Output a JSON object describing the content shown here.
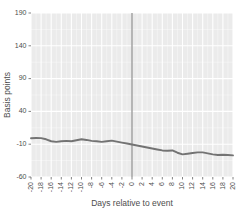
{
  "chart_data": {
    "type": "line",
    "title": "",
    "subtitle": "",
    "xlabel": "Days relative to event",
    "ylabel": "Basis points",
    "xlim": [
      -20,
      20
    ],
    "ylim": [
      -60,
      190
    ],
    "grid": true,
    "legend": null,
    "legend_position": "none",
    "x_ticks": [
      -20,
      -18,
      -16,
      -14,
      -12,
      -10,
      -8,
      -6,
      -4,
      -2,
      0,
      2,
      4,
      6,
      8,
      10,
      12,
      14,
      16,
      18,
      20
    ],
    "x_tick_labels": [
      "-20",
      "-18",
      "-16",
      "-14",
      "-12",
      "-10",
      "-8",
      "-6",
      "-4",
      "-2",
      "0",
      "2",
      "4",
      "6",
      "8",
      "10",
      "12",
      "14",
      "16",
      "18",
      "20"
    ],
    "y_ticks": [
      -60,
      -10,
      40,
      90,
      140,
      190
    ],
    "y_tick_labels": [
      "-60",
      "-10",
      "40",
      "90",
      "140",
      "190"
    ],
    "annotations": [
      {
        "name": "event-vertical-line",
        "type": "vline",
        "x": 0
      }
    ],
    "series": [
      {
        "name": "cumulative-abnormal-return",
        "color": "#737373",
        "x": [
          -20,
          -19,
          -18,
          -17,
          -16,
          -15,
          -14,
          -13,
          -12,
          -11,
          -10,
          -9,
          -8,
          -7,
          -6,
          -5,
          -4,
          -3,
          -2,
          -1,
          0,
          1,
          2,
          3,
          4,
          5,
          6,
          7,
          8,
          9,
          10,
          11,
          12,
          13,
          14,
          15,
          16,
          17,
          18,
          19,
          20
        ],
        "values": [
          -1.0,
          -0.5,
          -0.8,
          -2.5,
          -5.5,
          -6.5,
          -5.5,
          -5.0,
          -5.5,
          -4.0,
          -2.5,
          -3.5,
          -5.0,
          -5.5,
          -6.5,
          -5.5,
          -4.5,
          -6.0,
          -7.5,
          -9.0,
          -10.5,
          -12.0,
          -13.5,
          -15.0,
          -16.5,
          -18.0,
          -19.5,
          -20.0,
          -19.5,
          -23.0,
          -25.5,
          -24.5,
          -23.5,
          -22.5,
          -22.5,
          -24.0,
          -25.5,
          -26.5,
          -26.0,
          -26.5,
          -27.0
        ]
      }
    ]
  },
  "style": {
    "panel_background": "#ebebeb",
    "gridline_color": "#ffffff",
    "axis_text_color": "#4d4d4d",
    "line_color": "#737373",
    "vline_color": "#808080"
  }
}
